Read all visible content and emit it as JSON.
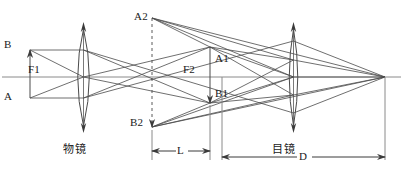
{
  "figure": {
    "type": "optical-ray-diagram",
    "width": 403,
    "height": 186,
    "background_color": "#ffffff",
    "line_color": "#4a4a4a",
    "axis_color": "#7a7a7a",
    "text_color": "#1a1a1a"
  },
  "labels": {
    "object_top": "B",
    "object_bottom": "A",
    "objective_focus": "F1",
    "eyepiece_focus": "F2",
    "image_top": "A1",
    "image_bottom": "B1",
    "virtual_top": "A2",
    "virtual_bottom": "B2",
    "objective_name": "物镜",
    "eyepiece_name": "目镜",
    "dim_l": "L",
    "dim_d": "D"
  },
  "geometry": {
    "axis_y": 77,
    "objective_x": 83,
    "eyepiece_x": 293,
    "dashed_x": 152,
    "image_arrow_x": 210,
    "object_arrow_x": 30,
    "converge_x": 385
  }
}
